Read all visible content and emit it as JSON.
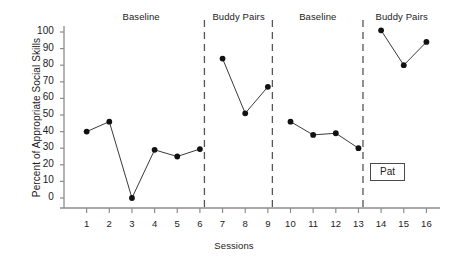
{
  "chart_data": {
    "type": "line",
    "title": "",
    "subtitle": "",
    "xlabel": "Sessions",
    "ylabel": "Percent of Appropriate Social Skills",
    "xlim": [
      0,
      16.6
    ],
    "ylim": [
      0,
      100
    ],
    "ytick_step": 10,
    "grid": false,
    "legend_position": "none",
    "marker": "filled-circle",
    "line_color": "#3a3a3a",
    "marker_color": "#111111",
    "axis_color": "#8c8c8c",
    "subject_label": "Pat",
    "x": [
      1,
      2,
      3,
      4,
      5,
      6,
      7,
      8,
      9,
      10,
      11,
      12,
      13,
      14,
      15,
      16
    ],
    "xtick_labels": [
      "1",
      "2",
      "3",
      "4",
      "5",
      "6",
      "7",
      "8",
      "9",
      "10",
      "11",
      "12",
      "13",
      "14",
      "15",
      "16"
    ],
    "ytick_labels": [
      "0",
      "10",
      "20",
      "30",
      "40",
      "50",
      "60",
      "70",
      "80",
      "90",
      "100"
    ],
    "phases": [
      {
        "name": "Baseline",
        "label": "Baseline",
        "x_start": 0.6,
        "x_end": 6.2,
        "points": [
          {
            "x": 1,
            "y": 40
          },
          {
            "x": 2,
            "y": 46
          },
          {
            "x": 3,
            "y": 0
          },
          {
            "x": 4,
            "y": 29
          },
          {
            "x": 5,
            "y": 25
          },
          {
            "x": 6,
            "y": 29.5
          }
        ]
      },
      {
        "name": "Buddy Pairs",
        "label": "Buddy Pairs",
        "x_start": 6.2,
        "x_end": 9.2,
        "points": [
          {
            "x": 7,
            "y": 84
          },
          {
            "x": 8,
            "y": 51
          },
          {
            "x": 9,
            "y": 67
          }
        ]
      },
      {
        "name": "Baseline",
        "label": "Baseline",
        "x_start": 9.2,
        "x_end": 13.2,
        "points": [
          {
            "x": 10,
            "y": 46
          },
          {
            "x": 11,
            "y": 38
          },
          {
            "x": 12,
            "y": 39
          },
          {
            "x": 13,
            "y": 30
          }
        ]
      },
      {
        "name": "Buddy Pairs",
        "label": "Buddy Pairs",
        "x_start": 13.2,
        "x_end": 16.6,
        "points": [
          {
            "x": 14,
            "y": 101
          },
          {
            "x": 15,
            "y": 80
          },
          {
            "x": 16,
            "y": 94
          }
        ]
      }
    ],
    "phase_lines": [
      6.2,
      9.2,
      13.2
    ]
  }
}
